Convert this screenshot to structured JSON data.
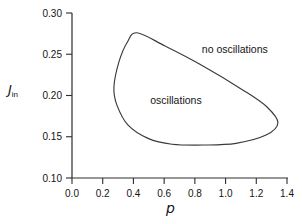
{
  "figure": {
    "background": "#ffffff",
    "axis_color": "#2e2e2e",
    "curve_color": "#3a3a3a",
    "text_color": "#141414",
    "xlabel": "p",
    "ylabel_main": "J",
    "ylabel_sub": "in"
  },
  "chart_data": {
    "type": "line",
    "title": "",
    "xlabel": "p",
    "ylabel": "J_in",
    "xlim": [
      0.0,
      1.4
    ],
    "ylim": [
      0.1,
      0.3
    ],
    "grid": false,
    "legend": "none",
    "x_ticks": [
      0.0,
      0.2,
      0.4,
      0.6,
      0.8,
      1.0,
      1.2,
      1.4
    ],
    "x_tick_labels": [
      "0.0",
      "0.2",
      "0.4",
      "0.6",
      "0.8",
      "1.0",
      "1.2",
      "1.4"
    ],
    "y_ticks": [
      0.1,
      0.15,
      0.2,
      0.25,
      0.3
    ],
    "y_tick_labels": [
      "0.10",
      "0.15",
      "0.20",
      "0.25",
      "0.30"
    ],
    "series": [
      {
        "name": "oscillation region boundary",
        "closed": true,
        "points": [
          [
            0.423,
            0.276
          ],
          [
            0.606,
            0.26
          ],
          [
            0.833,
            0.238
          ],
          [
            1.127,
            0.205
          ],
          [
            1.27,
            0.186
          ],
          [
            1.341,
            0.167
          ],
          [
            1.263,
            0.152
          ],
          [
            1.068,
            0.142
          ],
          [
            0.866,
            0.14
          ],
          [
            0.651,
            0.141
          ],
          [
            0.495,
            0.148
          ],
          [
            0.365,
            0.164
          ],
          [
            0.293,
            0.188
          ],
          [
            0.273,
            0.21
          ],
          [
            0.306,
            0.241
          ],
          [
            0.358,
            0.264
          ]
        ]
      }
    ],
    "annotations": [
      {
        "text": "oscillations",
        "x": 0.677,
        "y": 0.194,
        "region": "inside"
      },
      {
        "text": "no oscillations",
        "x": 1.06,
        "y": 0.256,
        "region": "outside"
      }
    ]
  }
}
